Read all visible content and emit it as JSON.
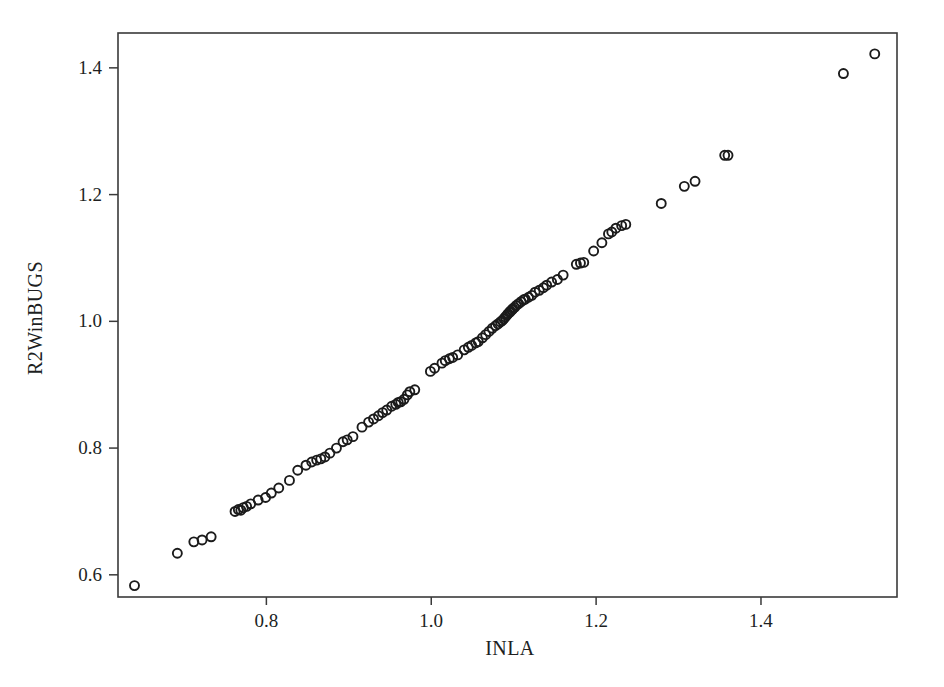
{
  "chart_data": {
    "type": "scatter",
    "title": "",
    "xlabel": "INLA",
    "ylabel": "R2WinBUGS",
    "xlim": [
      0.62,
      1.565
    ],
    "ylim": [
      0.565,
      1.455
    ],
    "xticks": [
      0.8,
      1.0,
      1.2,
      1.4
    ],
    "xtick_labels": [
      "0.8",
      "1.0",
      "1.2",
      "1.4"
    ],
    "yticks": [
      0.6,
      0.8,
      1.0,
      1.2,
      1.4
    ],
    "ytick_labels": [
      "0.6",
      "0.8",
      "1.0",
      "1.2",
      "1.4"
    ],
    "grid": false,
    "legend": null,
    "marker": "open-circle",
    "marker_color": "#1b1b1b",
    "marker_size": 9,
    "n_points": 100,
    "points": [
      [
        0.64,
        0.583
      ],
      [
        0.692,
        0.634
      ],
      [
        0.712,
        0.652
      ],
      [
        0.722,
        0.655
      ],
      [
        0.733,
        0.66
      ],
      [
        0.762,
        0.7
      ],
      [
        0.766,
        0.703
      ],
      [
        0.769,
        0.702
      ],
      [
        0.772,
        0.706
      ],
      [
        0.776,
        0.708
      ],
      [
        0.781,
        0.712
      ],
      [
        0.79,
        0.718
      ],
      [
        0.799,
        0.722
      ],
      [
        0.806,
        0.729
      ],
      [
        0.815,
        0.737
      ],
      [
        0.828,
        0.749
      ],
      [
        0.838,
        0.765
      ],
      [
        0.848,
        0.773
      ],
      [
        0.855,
        0.778
      ],
      [
        0.861,
        0.781
      ],
      [
        0.866,
        0.783
      ],
      [
        0.871,
        0.786
      ],
      [
        0.877,
        0.792
      ],
      [
        0.885,
        0.8
      ],
      [
        0.893,
        0.81
      ],
      [
        0.898,
        0.813
      ],
      [
        0.905,
        0.818
      ],
      [
        0.916,
        0.833
      ],
      [
        0.924,
        0.841
      ],
      [
        0.93,
        0.846
      ],
      [
        0.936,
        0.851
      ],
      [
        0.941,
        0.856
      ],
      [
        0.946,
        0.86
      ],
      [
        0.952,
        0.866
      ],
      [
        0.957,
        0.869
      ],
      [
        0.96,
        0.872
      ],
      [
        0.963,
        0.873
      ],
      [
        0.967,
        0.877
      ],
      [
        0.971,
        0.884
      ],
      [
        0.974,
        0.889
      ],
      [
        0.98,
        0.892
      ],
      [
        0.999,
        0.921
      ],
      [
        1.004,
        0.926
      ],
      [
        1.013,
        0.934
      ],
      [
        1.017,
        0.938
      ],
      [
        1.022,
        0.941
      ],
      [
        1.026,
        0.943
      ],
      [
        1.032,
        0.947
      ],
      [
        1.04,
        0.955
      ],
      [
        1.045,
        0.959
      ],
      [
        1.049,
        0.962
      ],
      [
        1.054,
        0.966
      ],
      [
        1.057,
        0.968
      ],
      [
        1.062,
        0.974
      ],
      [
        1.066,
        0.979
      ],
      [
        1.07,
        0.984
      ],
      [
        1.074,
        0.989
      ],
      [
        1.078,
        0.993
      ],
      [
        1.081,
        0.996
      ],
      [
        1.084,
        0.999
      ],
      [
        1.086,
        1.001
      ],
      [
        1.088,
        1.004
      ],
      [
        1.09,
        1.007
      ],
      [
        1.092,
        1.01
      ],
      [
        1.093,
        1.012
      ],
      [
        1.095,
        1.014
      ],
      [
        1.096,
        1.016
      ],
      [
        1.098,
        1.018
      ],
      [
        1.099,
        1.02
      ],
      [
        1.101,
        1.022
      ],
      [
        1.103,
        1.025
      ],
      [
        1.106,
        1.028
      ],
      [
        1.109,
        1.031
      ],
      [
        1.112,
        1.034
      ],
      [
        1.114,
        1.035
      ],
      [
        1.118,
        1.038
      ],
      [
        1.122,
        1.041
      ],
      [
        1.126,
        1.046
      ],
      [
        1.131,
        1.049
      ],
      [
        1.136,
        1.053
      ],
      [
        1.14,
        1.057
      ],
      [
        1.146,
        1.062
      ],
      [
        1.153,
        1.066
      ],
      [
        1.16,
        1.073
      ],
      [
        1.176,
        1.09
      ],
      [
        1.181,
        1.092
      ],
      [
        1.185,
        1.093
      ],
      [
        1.197,
        1.111
      ],
      [
        1.207,
        1.124
      ],
      [
        1.215,
        1.138
      ],
      [
        1.219,
        1.141
      ],
      [
        1.224,
        1.147
      ],
      [
        1.231,
        1.151
      ],
      [
        1.236,
        1.153
      ],
      [
        1.279,
        1.186
      ],
      [
        1.307,
        1.213
      ],
      [
        1.32,
        1.221
      ],
      [
        1.356,
        1.262
      ],
      [
        1.36,
        1.262
      ],
      [
        1.5,
        1.391
      ],
      [
        1.538,
        1.422
      ]
    ]
  },
  "axes": {
    "frame_color": "#3a3a3a",
    "background": "#ffffff"
  }
}
